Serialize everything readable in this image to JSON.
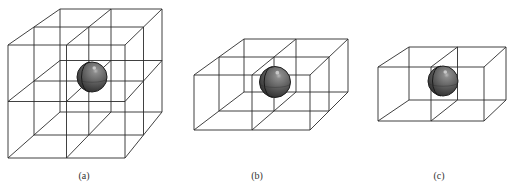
{
  "figure": {
    "background": "#ffffff",
    "line_color": "#2b2b2b",
    "sphere_color": "#5a5a5a",
    "panels": [
      {
        "id": "a",
        "caption": "(a)",
        "caption_x": 84,
        "grid": {
          "nx": 2,
          "ny": 2,
          "nz": 2
        },
        "front": {
          "tl": [
            8,
            45
          ],
          "tr": [
            125,
            45
          ],
          "bl": [
            8,
            158
          ],
          "br": [
            125,
            158
          ]
        },
        "back": {
          "tl": [
            60,
            9
          ],
          "tr": [
            162,
            9
          ],
          "bl": [
            60,
            112
          ],
          "br": [
            162,
            112
          ]
        },
        "sphere": {
          "cx": 92,
          "cy": 77,
          "r": 15
        }
      },
      {
        "id": "b",
        "caption": "(b)",
        "caption_x": 257,
        "grid": {
          "nx": 2,
          "ny": 1,
          "nz": 2
        },
        "front": {
          "tl": [
            194,
            75
          ],
          "tr": [
            310,
            75
          ],
          "bl": [
            194,
            130
          ],
          "br": [
            310,
            130
          ]
        },
        "back": {
          "tl": [
            244,
            39
          ],
          "tr": [
            348,
            39
          ],
          "bl": [
            244,
            92
          ],
          "br": [
            348,
            92
          ]
        },
        "sphere": {
          "cx": 275,
          "cy": 82,
          "r": 15.5
        }
      },
      {
        "id": "c",
        "caption": "(c)",
        "caption_x": 439,
        "grid": {
          "nx": 2,
          "ny": 1,
          "nz": 1
        },
        "front": {
          "tl": [
            378,
            67
          ],
          "tr": [
            484,
            67
          ],
          "bl": [
            378,
            121
          ],
          "br": [
            484,
            121
          ]
        },
        "back": {
          "tl": [
            409,
            47
          ],
          "tr": [
            506,
            47
          ],
          "bl": [
            409,
            100
          ],
          "br": [
            506,
            100
          ]
        },
        "sphere": {
          "cx": 443,
          "cy": 81,
          "r": 15
        }
      }
    ]
  }
}
